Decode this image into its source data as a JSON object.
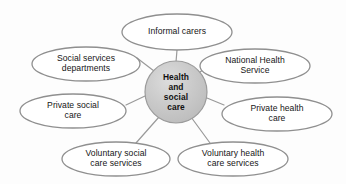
{
  "diagram": {
    "type": "hub-and-spoke-concept-map",
    "background_color": "#fdfdfd",
    "ellipse_stroke_color": "#8f8f8f",
    "ellipse_fill_color": "#ffffff",
    "connector_color": "#9a9a9a",
    "center_fill_color": "#c9c9c9",
    "center_stroke_color": "#9b9b9b",
    "text_color": "#161616",
    "center": {
      "label": "Health\nand\nsocial\ncare",
      "cx": 176,
      "cy": 92,
      "r": 31
    },
    "nodes": [
      {
        "id": "informal-carers",
        "label": "Informal carers",
        "cx": 177,
        "cy": 32,
        "rx": 55,
        "ry": 18
      },
      {
        "id": "social-services-departments",
        "label": "Social services\ndepartments",
        "cx": 86,
        "cy": 64,
        "rx": 54,
        "ry": 17
      },
      {
        "id": "national-health-service",
        "label": "National Health\nService",
        "cx": 255,
        "cy": 66,
        "rx": 55,
        "ry": 17
      },
      {
        "id": "private-social-care",
        "label": "Private social\ncare",
        "cx": 73,
        "cy": 111,
        "rx": 53,
        "ry": 17
      },
      {
        "id": "private-health-care",
        "label": "Private health\ncare",
        "cx": 277,
        "cy": 114,
        "rx": 55,
        "ry": 17
      },
      {
        "id": "voluntary-social-care-services",
        "label": "Voluntary social\ncare services",
        "cx": 116,
        "cy": 159,
        "rx": 54,
        "ry": 17
      },
      {
        "id": "voluntary-health-care-services",
        "label": "Voluntary health\ncare services",
        "cx": 233,
        "cy": 159,
        "rx": 55,
        "ry": 17
      }
    ],
    "connectors": [
      {
        "id": "center-to-informal-carers",
        "x1": 176,
        "y1": 62,
        "x2": 177,
        "y2": 50
      },
      {
        "id": "center-to-social-services-departments",
        "x1": 154,
        "y1": 71,
        "x2": 137,
        "y2": 58
      },
      {
        "id": "center-to-national-health-service",
        "x1": 199,
        "y1": 73,
        "x2": 213,
        "y2": 61
      },
      {
        "id": "center-to-private-social-care",
        "x1": 145,
        "y1": 96,
        "x2": 126,
        "y2": 105
      },
      {
        "id": "center-to-private-health-care",
        "x1": 207,
        "y1": 98,
        "x2": 224,
        "y2": 105
      },
      {
        "id": "center-to-voluntary-social-care-services",
        "x1": 159,
        "y1": 117,
        "x2": 136,
        "y2": 143
      },
      {
        "id": "center-to-voluntary-health-care-services",
        "x1": 191,
        "y1": 117,
        "x2": 210,
        "y2": 143
      }
    ]
  }
}
